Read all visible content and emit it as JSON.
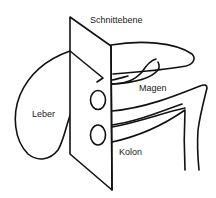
{
  "diagram": {
    "labels": {
      "plane": "Schnittebene",
      "liver": "Leber",
      "stomach": "Magen",
      "colon": "Kolon"
    },
    "stroke_color": "#111111",
    "background": "#ffffff"
  }
}
